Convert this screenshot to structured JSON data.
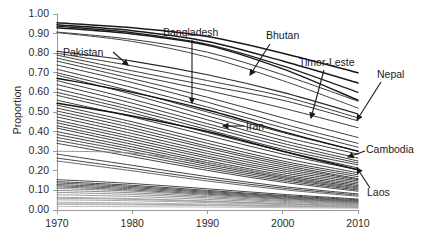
{
  "chart_data": {
    "type": "line",
    "title": "",
    "xlabel": "",
    "ylabel": "Proportion",
    "xlim": [
      1970,
      2010
    ],
    "ylim": [
      0.0,
      1.0
    ],
    "grid": false,
    "legend_position": "none",
    "x_ticks": [
      "1970",
      "1980",
      "1990",
      "2000",
      "2010"
    ],
    "x_tick_values": [
      1970,
      1980,
      1990,
      2000,
      2010
    ],
    "y_ticks": [
      "0.00",
      "0.10",
      "0.20",
      "0.30",
      "0.40",
      "0.50",
      "0.60",
      "0.70",
      "0.80",
      "0.90",
      "1.00"
    ],
    "y_tick_values": [
      0.0,
      0.1,
      0.2,
      0.3,
      0.4,
      0.5,
      0.6,
      0.7,
      0.8,
      0.9,
      1.0
    ],
    "x": [
      1970,
      1980,
      1990,
      2000,
      2010
    ],
    "annotations": [
      {
        "label": "Pakistan",
        "x": 63,
        "y": 47,
        "arrow": {
          "x1": 113,
          "y1": 52,
          "x2": 128,
          "y2": 65
        }
      },
      {
        "label": "Bangladesh",
        "x": 163,
        "y": 27,
        "arrow": {
          "x1": 192,
          "y1": 40,
          "x2": 192,
          "y2": 103
        }
      },
      {
        "label": "Bhutan",
        "x": 266,
        "y": 30,
        "arrow": {
          "x1": 270,
          "y1": 44,
          "x2": 250,
          "y2": 75
        }
      },
      {
        "label": "Timor-Leste",
        "x": 299,
        "y": 57,
        "arrow": {
          "x1": 324,
          "y1": 70,
          "x2": 311,
          "y2": 118
        }
      },
      {
        "label": "Nepal",
        "x": 377,
        "y": 69,
        "arrow": {
          "x1": 381,
          "y1": 82,
          "x2": 357,
          "y2": 120
        }
      },
      {
        "label": "Iran",
        "x": 246,
        "y": 121,
        "arrow": {
          "x1": 244,
          "y1": 126,
          "x2": 223,
          "y2": 126
        }
      },
      {
        "label": "Cambodia",
        "x": 366,
        "y": 144,
        "arrow": {
          "x1": 365,
          "y1": 151,
          "x2": 348,
          "y2": 157
        }
      },
      {
        "label": "Laos",
        "x": 367,
        "y": 187,
        "arrow": {
          "x1": 370,
          "y1": 188,
          "x2": 357,
          "y2": 168
        }
      }
    ],
    "series": [
      {
        "name": "series-01",
        "values": [
          0.955,
          0.93,
          0.885,
          0.8,
          0.7
        ],
        "weight": 1.5,
        "color": "#1a1a1a"
      },
      {
        "name": "series-02",
        "values": [
          0.945,
          0.915,
          0.86,
          0.76,
          0.648
        ],
        "weight": 1.5,
        "color": "#1a1a1a"
      },
      {
        "name": "series-03",
        "values": [
          0.938,
          0.905,
          0.845,
          0.735,
          0.6
        ],
        "weight": 1.3,
        "color": "#222222"
      },
      {
        "name": "series-04",
        "values": [
          0.93,
          0.898,
          0.84,
          0.72,
          0.56
        ],
        "weight": 1.5,
        "color": "#1a1a1a"
      },
      {
        "name": "series-05",
        "values": [
          0.908,
          0.87,
          0.805,
          0.69,
          0.555
        ],
        "weight": 1.0,
        "color": "#3a3a3a"
      },
      {
        "name": "series-06",
        "values": [
          0.905,
          0.86,
          0.78,
          0.66,
          0.52
        ],
        "weight": 1.0,
        "color": "#444444"
      },
      {
        "name": "series-07",
        "values": [
          0.81,
          0.76,
          0.69,
          0.6,
          0.49
        ],
        "weight": 1.2,
        "color": "#2a2a2a"
      },
      {
        "name": "series-08",
        "values": [
          0.8,
          0.735,
          0.66,
          0.58,
          0.47
        ],
        "weight": 1.0,
        "color": "#3a3a3a"
      },
      {
        "name": "series-09",
        "values": [
          0.79,
          0.71,
          0.635,
          0.56,
          0.455
        ],
        "weight": 1.0,
        "color": "#3a3a3a"
      },
      {
        "name": "series-10",
        "values": [
          0.775,
          0.69,
          0.61,
          0.52,
          0.42
        ],
        "weight": 1.0,
        "color": "#3a3a3a"
      },
      {
        "name": "series-11",
        "values": [
          0.76,
          0.67,
          0.575,
          0.47,
          0.37
        ],
        "weight": 1.0,
        "color": "#3a3a3a"
      },
      {
        "name": "series-12",
        "values": [
          0.74,
          0.65,
          0.55,
          0.44,
          0.34
        ],
        "weight": 1.0,
        "color": "#3a3a3a"
      },
      {
        "name": "series-13",
        "values": [
          0.718,
          0.625,
          0.525,
          0.42,
          0.32
        ],
        "weight": 1.0,
        "color": "#3a3a3a"
      },
      {
        "name": "series-14",
        "values": [
          0.7,
          0.605,
          0.5,
          0.395,
          0.3
        ],
        "weight": 1.0,
        "color": "#3a3a3a"
      },
      {
        "name": "series-15",
        "values": [
          0.688,
          0.59,
          0.48,
          0.375,
          0.285
        ],
        "weight": 1.0,
        "color": "#3a3a3a"
      },
      {
        "name": "series-16",
        "values": [
          0.672,
          0.6,
          0.51,
          0.4,
          0.3
        ],
        "weight": 1.4,
        "color": "#141414"
      },
      {
        "name": "series-17",
        "values": [
          0.66,
          0.565,
          0.46,
          0.355,
          0.265
        ],
        "weight": 1.0,
        "color": "#3a3a3a"
      },
      {
        "name": "series-18",
        "values": [
          0.64,
          0.545,
          0.44,
          0.34,
          0.25
        ],
        "weight": 1.0,
        "color": "#3a3a3a"
      },
      {
        "name": "series-19",
        "values": [
          0.618,
          0.525,
          0.425,
          0.325,
          0.24
        ],
        "weight": 1.0,
        "color": "#3a3a3a"
      },
      {
        "name": "series-20",
        "values": [
          0.6,
          0.51,
          0.41,
          0.31,
          0.23
        ],
        "weight": 1.0,
        "color": "#3a3a3a"
      },
      {
        "name": "series-21",
        "values": [
          0.585,
          0.495,
          0.395,
          0.3,
          0.215
        ],
        "weight": 1.0,
        "color": "#3a3a3a"
      },
      {
        "name": "series-22",
        "values": [
          0.56,
          0.475,
          0.38,
          0.285,
          0.205
        ],
        "weight": 1.0,
        "color": "#3a3a3a"
      },
      {
        "name": "series-23",
        "values": [
          0.545,
          0.48,
          0.4,
          0.3,
          0.205
        ],
        "weight": 1.5,
        "color": "#141414"
      },
      {
        "name": "series-24",
        "values": [
          0.535,
          0.45,
          0.355,
          0.265,
          0.19
        ],
        "weight": 1.0,
        "color": "#3a3a3a"
      },
      {
        "name": "series-25",
        "values": [
          0.52,
          0.435,
          0.34,
          0.25,
          0.18
        ],
        "weight": 1.0,
        "color": "#3a3a3a"
      },
      {
        "name": "series-26",
        "values": [
          0.505,
          0.42,
          0.325,
          0.24,
          0.17
        ],
        "weight": 1.0,
        "color": "#3a3a3a"
      },
      {
        "name": "series-27",
        "values": [
          0.49,
          0.405,
          0.315,
          0.23,
          0.16
        ],
        "weight": 1.0,
        "color": "#3a3a3a"
      },
      {
        "name": "series-28",
        "values": [
          0.475,
          0.39,
          0.3,
          0.22,
          0.155
        ],
        "weight": 1.0,
        "color": "#3a3a3a"
      },
      {
        "name": "series-29",
        "values": [
          0.458,
          0.375,
          0.288,
          0.21,
          0.148
        ],
        "weight": 1.0,
        "color": "#3a3a3a"
      },
      {
        "name": "series-30",
        "values": [
          0.445,
          0.362,
          0.275,
          0.2,
          0.14
        ],
        "weight": 1.0,
        "color": "#3a3a3a"
      },
      {
        "name": "series-31",
        "values": [
          0.43,
          0.348,
          0.265,
          0.19,
          0.132
        ],
        "weight": 1.0,
        "color": "#3a3a3a"
      },
      {
        "name": "series-32",
        "values": [
          0.418,
          0.335,
          0.252,
          0.18,
          0.125
        ],
        "weight": 1.0,
        "color": "#3a3a3a"
      },
      {
        "name": "series-33",
        "values": [
          0.4,
          0.322,
          0.242,
          0.172,
          0.118
        ],
        "weight": 1.0,
        "color": "#3a3a3a"
      },
      {
        "name": "series-34",
        "values": [
          0.385,
          0.31,
          0.232,
          0.165,
          0.112
        ],
        "weight": 1.0,
        "color": "#3a3a3a"
      },
      {
        "name": "series-35",
        "values": [
          0.37,
          0.298,
          0.222,
          0.158,
          0.108
        ],
        "weight": 1.0,
        "color": "#444444"
      },
      {
        "name": "series-36",
        "values": [
          0.355,
          0.285,
          0.212,
          0.15,
          0.102
        ],
        "weight": 1.0,
        "color": "#444444"
      },
      {
        "name": "series-37",
        "values": [
          0.34,
          0.272,
          0.202,
          0.142,
          0.096
        ],
        "weight": 1.0,
        "color": "#444444"
      },
      {
        "name": "series-38",
        "values": [
          0.3,
          0.29,
          0.24,
          0.17,
          0.11
        ],
        "weight": 0.9,
        "color": "#8a8a8a"
      },
      {
        "name": "series-39",
        "values": [
          0.285,
          0.228,
          0.17,
          0.12,
          0.082
        ],
        "weight": 1.0,
        "color": "#444444"
      },
      {
        "name": "series-40",
        "values": [
          0.265,
          0.212,
          0.158,
          0.112,
          0.076
        ],
        "weight": 1.0,
        "color": "#444444"
      },
      {
        "name": "series-41",
        "values": [
          0.25,
          0.2,
          0.148,
          0.104,
          0.07
        ],
        "weight": 0.9,
        "color": "#555555"
      },
      {
        "name": "series-42",
        "values": [
          0.155,
          0.135,
          0.108,
          0.08,
          0.056
        ],
        "weight": 1.0,
        "color": "#444444"
      },
      {
        "name": "series-43",
        "values": [
          0.145,
          0.126,
          0.1,
          0.074,
          0.052
        ],
        "weight": 1.0,
        "color": "#444444"
      },
      {
        "name": "series-44",
        "values": [
          0.138,
          0.12,
          0.095,
          0.07,
          0.048
        ],
        "weight": 1.0,
        "color": "#555555"
      },
      {
        "name": "series-45",
        "values": [
          0.13,
          0.114,
          0.09,
          0.066,
          0.045
        ],
        "weight": 1.0,
        "color": "#555555"
      },
      {
        "name": "series-46",
        "values": [
          0.124,
          0.108,
          0.085,
          0.062,
          0.042
        ],
        "weight": 1.0,
        "color": "#666666"
      },
      {
        "name": "series-47",
        "values": [
          0.118,
          0.102,
          0.08,
          0.058,
          0.039
        ],
        "weight": 1.0,
        "color": "#666666"
      },
      {
        "name": "series-48",
        "values": [
          0.11,
          0.096,
          0.075,
          0.054,
          0.036
        ],
        "weight": 0.9,
        "color": "#777777"
      },
      {
        "name": "series-49",
        "values": [
          0.1,
          0.088,
          0.068,
          0.049,
          0.033
        ],
        "weight": 0.9,
        "color": "#7d7d7d"
      },
      {
        "name": "series-50",
        "values": [
          0.09,
          0.079,
          0.062,
          0.044,
          0.03
        ],
        "weight": 0.9,
        "color": "#858585"
      },
      {
        "name": "series-51",
        "values": [
          0.078,
          0.069,
          0.054,
          0.039,
          0.026
        ],
        "weight": 0.9,
        "color": "#8d8d8d"
      },
      {
        "name": "series-52",
        "values": [
          0.065,
          0.058,
          0.046,
          0.033,
          0.022
        ],
        "weight": 0.9,
        "color": "#959595"
      },
      {
        "name": "series-53",
        "values": [
          0.052,
          0.047,
          0.038,
          0.027,
          0.019
        ],
        "weight": 0.9,
        "color": "#9d9d9d"
      },
      {
        "name": "series-54",
        "values": [
          0.04,
          0.036,
          0.03,
          0.022,
          0.015
        ],
        "weight": 0.9,
        "color": "#a5a5a5"
      },
      {
        "name": "series-55",
        "values": [
          0.028,
          0.026,
          0.022,
          0.017,
          0.012
        ],
        "weight": 0.9,
        "color": "#adadad"
      },
      {
        "name": "series-56",
        "values": [
          0.018,
          0.017,
          0.015,
          0.012,
          0.009
        ],
        "weight": 0.9,
        "color": "#b5b5b5"
      },
      {
        "name": "series-57",
        "values": [
          0.032,
          0.03,
          0.026,
          0.02,
          0.014
        ],
        "weight": 0.9,
        "color": "#a0a0a0"
      },
      {
        "name": "series-58",
        "values": [
          0.06,
          0.054,
          0.043,
          0.031,
          0.021
        ],
        "weight": 0.9,
        "color": "#999999"
      }
    ]
  },
  "plot_geometry": {
    "left": 57,
    "right": 358,
    "top": 14,
    "bottom": 210,
    "axis_color": "#9a9a9a"
  }
}
